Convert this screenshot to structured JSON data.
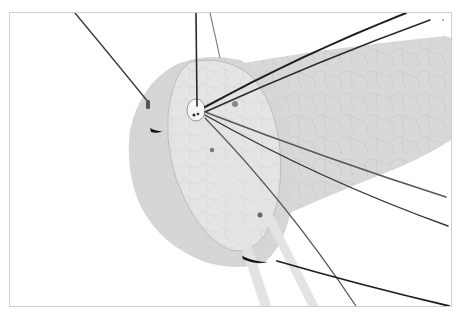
{
  "figure": {
    "colors": {
      "background": "#ffffff",
      "frame": "#cfcfcf",
      "cylinder_body": "#d6d6d6",
      "disc_face": "#e2e2e2",
      "disc_outer": "#d3d3d3",
      "cell_lines": "#c4c4c4",
      "fiber_dark": "#2a2a2a",
      "fiber_mid": "#555555",
      "tubes": "#e6e6e6",
      "marker": "#6a6a6a",
      "hub": "#f4f4f4"
    },
    "fiber_count": 9,
    "marker_count": 5
  }
}
